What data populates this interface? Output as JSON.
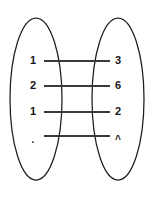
{
  "diagram": {
    "type": "mapping-diagram",
    "title": "",
    "background_color": "#ffffff",
    "stroke_color": "#1d1d1d",
    "line_color": "#3a3a3a",
    "text_color": "#161616",
    "left_set": {
      "name": "left-set",
      "shape": "ellipse",
      "cx": 36,
      "cy": 99,
      "rx": 26,
      "ry": 81,
      "items": [
        {
          "label": "1",
          "x": 33,
          "y": 61
        },
        {
          "label": "2",
          "x": 33,
          "y": 86
        },
        {
          "label": "1",
          "x": 33,
          "y": 112
        },
        {
          "label": ".",
          "x": 33,
          "y": 140
        }
      ]
    },
    "right_set": {
      "name": "right-set",
      "shape": "ellipse",
      "cx": 118,
      "cy": 99,
      "rx": 26,
      "ry": 81,
      "items": [
        {
          "label": "3",
          "x": 118,
          "y": 61
        },
        {
          "label": "6",
          "x": 118,
          "y": 86
        },
        {
          "label": "2",
          "x": 118,
          "y": 112
        },
        {
          "label": "^",
          "x": 118,
          "y": 140
        }
      ]
    },
    "connections": [
      {
        "name": "connection-1",
        "x1": 44,
        "y1": 61,
        "x2": 110,
        "y2": 61
      },
      {
        "name": "connection-2",
        "x1": 44,
        "y1": 86,
        "x2": 110,
        "y2": 86
      },
      {
        "name": "connection-3",
        "x1": 44,
        "y1": 112,
        "x2": 110,
        "y2": 112
      },
      {
        "name": "connection-4",
        "x1": 44,
        "y1": 136,
        "x2": 110,
        "y2": 136
      }
    ]
  }
}
